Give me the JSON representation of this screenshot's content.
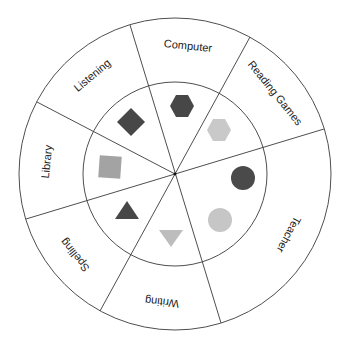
{
  "diagram": {
    "type": "center-wheel",
    "center": {
      "x": 175,
      "y": 174
    },
    "outer_radius": 156,
    "inner_radius": 92,
    "label_radius": 128,
    "colors": {
      "line": "#3a3a3a",
      "dark": "#474747",
      "medium": "#a3a3a3",
      "light": "#c9c9c9"
    },
    "dividers": [
      {
        "from_angle": -17,
        "to_angle": 163
      },
      {
        "from_angle": 28.7,
        "to_angle": 208.7
      },
      {
        "from_angle": 73.3,
        "to_angle": 253.3
      },
      {
        "from_angle": 297.6,
        "to_angle": null
      }
    ],
    "sectors": [
      {
        "label": "Computer",
        "mid_angle": 5.8,
        "shape": "hexagon",
        "color": "dark",
        "shape_pos": {
          "x": 182,
          "y": 106
        }
      },
      {
        "label": "Reading Games",
        "mid_angle": 51,
        "shape": "hexagon",
        "color": "light",
        "shape_pos": {
          "x": 219,
          "y": 130
        }
      },
      {
        "label": "Teacher",
        "mid_angle": 118,
        "shape": "circles",
        "color": "dark+light",
        "shape_pos": {
          "x": 243,
          "y": 178
        }
      },
      {
        "label": "Writing",
        "mid_angle": 185.8,
        "shape": "inverted-triangle",
        "color": "light",
        "shape_pos": {
          "x": 171,
          "y": 236
        }
      },
      {
        "label": "Spelling",
        "mid_angle": 231,
        "shape": "triangle",
        "color": "dark",
        "shape_pos": {
          "x": 127,
          "y": 210
        }
      },
      {
        "label": "Library",
        "mid_angle": 275.5,
        "shape": "square",
        "color": "medium",
        "shape_pos": {
          "x": 110,
          "y": 167
        }
      },
      {
        "label": "Listening",
        "mid_angle": 320,
        "shape": "diamond",
        "color": "dark",
        "shape_pos": {
          "x": 131,
          "y": 122
        }
      }
    ]
  }
}
